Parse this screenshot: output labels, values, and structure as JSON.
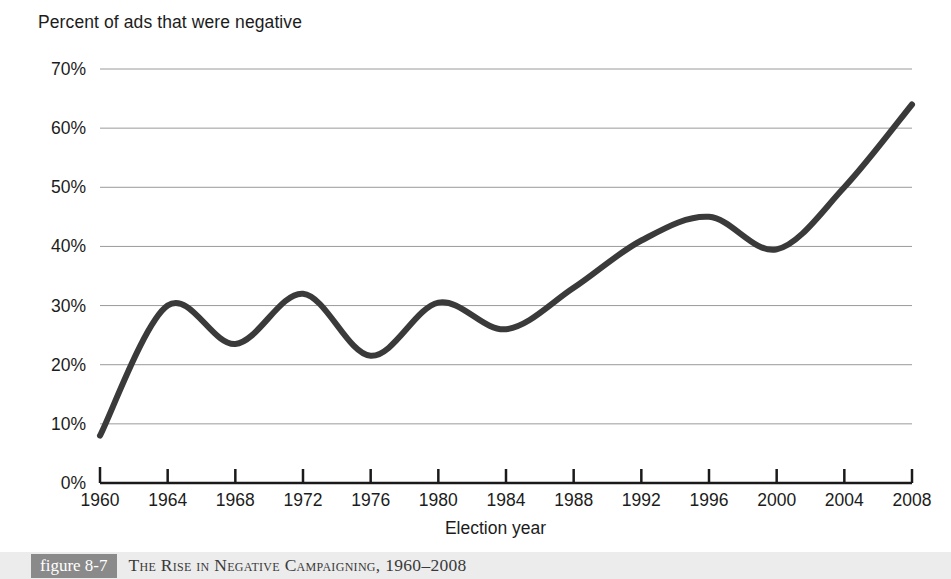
{
  "figure": {
    "caption_tag": "figure 8-7",
    "caption_text": "The Rise in Negative Campaigning, 1960–2008",
    "tag_background": "#8a8a8a",
    "band_background": "#ececec"
  },
  "chart_data": {
    "type": "line",
    "title": "Percent of ads that were negative",
    "xlabel": "Election year",
    "ylabel": "",
    "categories": [
      1960,
      1964,
      1968,
      1972,
      1976,
      1980,
      1984,
      1988,
      1992,
      1996,
      2000,
      2004,
      2008
    ],
    "x": [
      1960,
      1964,
      1968,
      1972,
      1976,
      1980,
      1984,
      1988,
      1992,
      1996,
      2000,
      2004,
      2008
    ],
    "values": [
      8,
      30,
      23.5,
      32,
      21.5,
      30.5,
      26,
      33,
      41,
      45,
      39.5,
      50,
      64
    ],
    "xtick_labels": [
      "1960",
      "1964",
      "1968",
      "1972",
      "1976",
      "1980",
      "1984",
      "1988",
      "1992",
      "1996",
      "2000",
      "2004",
      "2008"
    ],
    "ytick_labels": [
      "70%",
      "60%",
      "50%",
      "40%",
      "30%",
      "20%",
      "10%",
      "0%"
    ],
    "ytick_values": [
      70,
      60,
      50,
      40,
      30,
      20,
      10,
      0
    ],
    "ylim": [
      0,
      70
    ],
    "xlim": [
      1960,
      2008
    ],
    "grid": "horizontal",
    "legend": "none",
    "line_color": "#3a3a3a",
    "grid_color": "#9a9a9a",
    "axis_color": "#1a1a1a",
    "smoothing": "spline"
  }
}
